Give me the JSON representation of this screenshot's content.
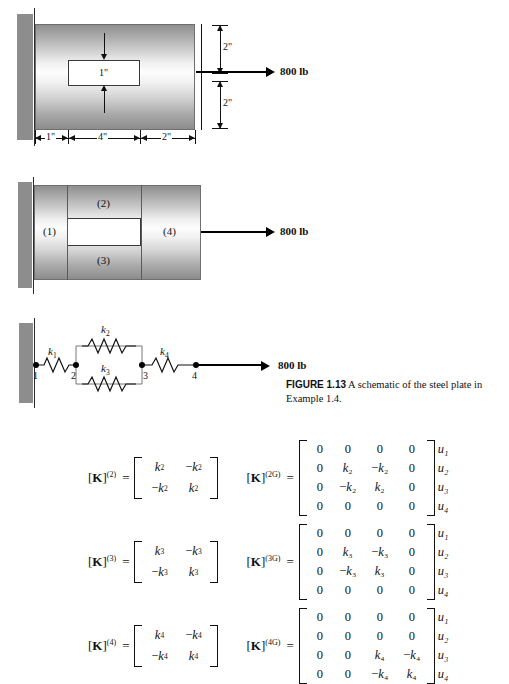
{
  "figure": {
    "caption_label": "FIGURE 1.13",
    "caption_text": "A schematic of the steel plate in Example 1.4."
  },
  "diagram_top": {
    "load_label": "800 lb",
    "hole_label": "1\"",
    "dim_top": "2\"",
    "dim_bottom": "2\"",
    "dim_seg1": "1\"",
    "dim_seg2": "4\"",
    "dim_seg3": "2\""
  },
  "diagram_middle": {
    "load_label": "800 lb",
    "elements": [
      "(1)",
      "(2)",
      "(3)",
      "(4)"
    ]
  },
  "diagram_spring": {
    "load_label": "800 lb",
    "springs": [
      "k",
      "k",
      "k",
      "k"
    ],
    "spring_subs": [
      "1",
      "2",
      "3",
      "4"
    ],
    "nodes": [
      "1",
      "2",
      "3",
      "4"
    ]
  },
  "equations": [
    {
      "local_name": "K",
      "local_sup": "(2)",
      "equals": "=",
      "local_matrix": [
        [
          "k",
          "−k"
        ],
        [
          "−k",
          "k"
        ]
      ],
      "local_sub": "2",
      "global_name": "K",
      "global_sup": "(2G)",
      "global_matrix": [
        [
          "0",
          "0",
          "0",
          "0"
        ],
        [
          "0",
          "k₂",
          "−k₂",
          "0"
        ],
        [
          "0",
          "−k₂",
          "k₂",
          "0"
        ],
        [
          "0",
          "0",
          "0",
          "0"
        ]
      ],
      "u_labels": [
        "u₁",
        "u₂",
        "u₃",
        "u₄"
      ]
    },
    {
      "local_name": "K",
      "local_sup": "(3)",
      "equals": "=",
      "local_matrix": [
        [
          "k",
          "−k"
        ],
        [
          "−k",
          "k"
        ]
      ],
      "local_sub": "3",
      "global_name": "K",
      "global_sup": "(3G)",
      "global_matrix": [
        [
          "0",
          "0",
          "0",
          "0"
        ],
        [
          "0",
          "k₃",
          "−k₃",
          "0"
        ],
        [
          "0",
          "−k₃",
          "k₃",
          "0"
        ],
        [
          "0",
          "0",
          "0",
          "0"
        ]
      ],
      "u_labels": [
        "u₁",
        "u₂",
        "u₃",
        "u₄"
      ]
    },
    {
      "local_name": "K",
      "local_sup": "(4)",
      "equals": "=",
      "local_matrix": [
        [
          "k",
          "−k"
        ],
        [
          "−k",
          "k"
        ]
      ],
      "local_sub": "4",
      "global_name": "K",
      "global_sup": "(4G)",
      "global_matrix": [
        [
          "0",
          "0",
          "0",
          "0"
        ],
        [
          "0",
          "0",
          "0",
          "0"
        ],
        [
          "0",
          "0",
          "k₄",
          "−k₄"
        ],
        [
          "0",
          "0",
          "−k₄",
          "k₄"
        ]
      ],
      "u_labels": [
        "u₁",
        "u₂",
        "u₃",
        "u₄"
      ]
    }
  ]
}
